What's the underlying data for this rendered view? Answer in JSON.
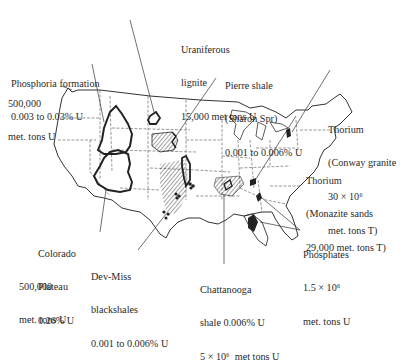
{
  "figure": {
    "colors": {
      "ink": "#2a2a2a",
      "background": "#ffffff",
      "deposit_fill": "#222222"
    }
  },
  "labels": {
    "phosphoria": {
      "line1": "Phosphoria formation",
      "line2": "0.003 to 0.03% U"
    },
    "phosphoria_tonnage": {
      "line1": "500,000",
      "line2": "met. tons U"
    },
    "uraniferous": {
      "line1": "Uraniferous",
      "line2": "lignite",
      "line3": "15,000 met tons U"
    },
    "pierre": {
      "line1": "Pierre shale",
      "line2": "(Sharon Spr)",
      "line3": "0.001 to 0.006% U"
    },
    "conway": {
      "line1": "Thorium",
      "line2": "(Conway granite",
      "line3": "30 × 10⁶",
      "line4": "met. tons T)"
    },
    "monazite": {
      "line1": "Thorium",
      "line2": "(Monazite sands",
      "line3": "29,000 met. tons T)"
    },
    "colorado": {
      "line1": "Colorado",
      "line2": "Plateau",
      "line3": "0.26% U"
    },
    "colorado_tonnage": {
      "line1": "500,000",
      "line2": "met. tons U"
    },
    "devmiss": {
      "line1": "Dev-Miss",
      "line2": "blackshales",
      "line3": "0.001 to 0.006% U"
    },
    "chattanooga": {
      "line1": "Chattanooga",
      "line2": "shale 0.006% U",
      "line3": "5 × 10⁶  met tons U"
    },
    "phosphates": {
      "line1": "Phosphates",
      "line2": "1.5 × 10⁶",
      "line3": "met. tons U"
    }
  }
}
